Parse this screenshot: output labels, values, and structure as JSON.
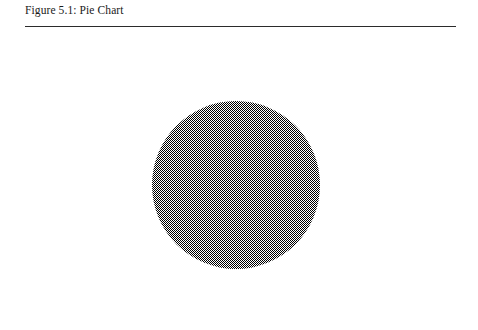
{
  "figure": {
    "caption": "Figure 5.1: Pie Chart",
    "rule_color": "#2b2b2b",
    "background_color": "#ffffff"
  },
  "chart_data": {
    "type": "pie",
    "title": "Figure 5.1: Pie Chart",
    "subtitle": "",
    "xlabel": "",
    "ylabel": "",
    "categories": [
      "Total"
    ],
    "values": [
      100
    ],
    "units": "percent",
    "slice_fills": [
      "50% gray checkerboard dither"
    ],
    "slice_colors": [
      "#808080"
    ],
    "outline": "none",
    "divider_lines": "none",
    "legend": "none",
    "legend_position": "none",
    "data_labels": "none",
    "grid": false,
    "center_x": 236,
    "center_y": 185,
    "diameter_px": 168,
    "start_angle_deg": 0,
    "annotations": []
  }
}
